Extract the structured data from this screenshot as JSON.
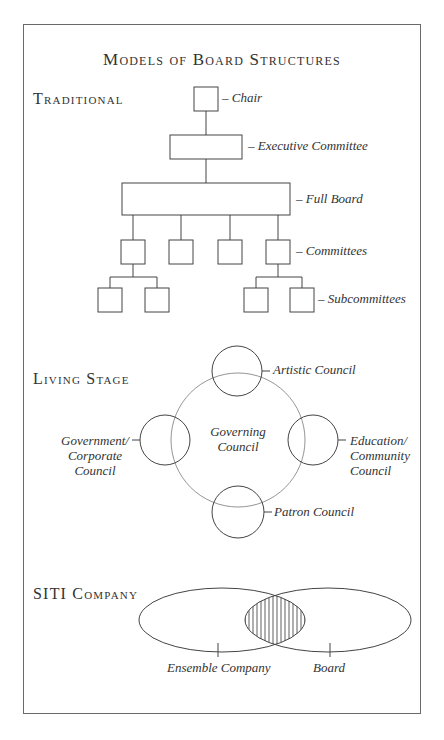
{
  "title": "Models of Board Structures",
  "sections": {
    "traditional": {
      "heading": "Traditional",
      "labels": {
        "chair": "– Chair",
        "executive": "– Executive Committee",
        "full_board": "– Full Board",
        "committees": "– Committees",
        "subcommittees": "– Subcommittees"
      }
    },
    "living_stage": {
      "heading": "Living Stage",
      "labels": {
        "artistic": "Artistic Council",
        "governing_1": "Governing",
        "governing_2": "Council",
        "government_1": "Government/",
        "government_2": "Corporate",
        "government_3": "Council",
        "education_1": "Education/",
        "education_2": "Community",
        "education_3": "Council",
        "patron": "Patron Council"
      }
    },
    "siti": {
      "heading": "SITI Company",
      "labels": {
        "ensemble": "Ensemble Company",
        "board": "Board"
      }
    }
  }
}
